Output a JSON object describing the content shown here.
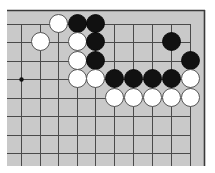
{
  "board": {
    "background": "#c9c9c9",
    "line_color": "#4a4a4a",
    "border_color": "#3a3a3a",
    "area": {
      "left": 7,
      "top": 10,
      "right": 204,
      "bottom": 166
    },
    "columns_x": [
      21,
      40,
      58,
      77,
      95,
      114,
      133,
      152,
      171,
      190
    ],
    "rows_y": [
      24,
      42,
      61,
      79,
      98,
      116,
      135,
      153
    ],
    "open_left": true,
    "open_bottom": true,
    "top_edge": true,
    "right_edge_line_col": 9,
    "star_points": [
      {
        "col": 0,
        "row": 3
      }
    ],
    "stone_radius": 9
  },
  "stones": [
    {
      "color": "white",
      "col": 2,
      "row": 0
    },
    {
      "color": "black",
      "col": 3,
      "row": 0
    },
    {
      "color": "black",
      "col": 4,
      "row": 0
    },
    {
      "color": "white",
      "col": 1,
      "row": 1
    },
    {
      "color": "white",
      "col": 3,
      "row": 1
    },
    {
      "color": "black",
      "col": 4,
      "row": 1
    },
    {
      "color": "black",
      "col": 8,
      "row": 1
    },
    {
      "color": "white",
      "col": 3,
      "row": 2
    },
    {
      "color": "black",
      "col": 4,
      "row": 2
    },
    {
      "color": "black",
      "col": 9,
      "row": 2
    },
    {
      "color": "white",
      "col": 3,
      "row": 3
    },
    {
      "color": "white",
      "col": 4,
      "row": 3
    },
    {
      "color": "black",
      "col": 5,
      "row": 3
    },
    {
      "color": "black",
      "col": 6,
      "row": 3
    },
    {
      "color": "black",
      "col": 7,
      "row": 3
    },
    {
      "color": "black",
      "col": 8,
      "row": 3
    },
    {
      "color": "white",
      "col": 9,
      "row": 3
    },
    {
      "color": "white",
      "col": 5,
      "row": 4
    },
    {
      "color": "white",
      "col": 6,
      "row": 4
    },
    {
      "color": "white",
      "col": 7,
      "row": 4
    },
    {
      "color": "white",
      "col": 8,
      "row": 4
    },
    {
      "color": "white",
      "col": 9,
      "row": 4
    }
  ]
}
